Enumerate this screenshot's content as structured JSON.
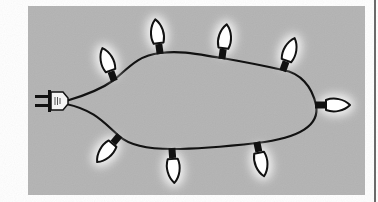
{
  "illustration": {
    "subject": "string of holiday lights with plug",
    "panel": {
      "x": 28,
      "y": 6,
      "width": 337,
      "height": 189,
      "fill": "#b3b3b3"
    },
    "colors": {
      "background": "#ffffff",
      "panel": "#b3b3b3",
      "wire": "#111111",
      "bulb_fill": "#ffffff",
      "bulb_outline": "#111111",
      "glow": "#ffffff",
      "edge_line": "#6a6a6a"
    },
    "plug": {
      "x": 35,
      "y": 92,
      "label": "plug-icon"
    },
    "bulbs": [
      {
        "id": "bulb-1",
        "base": [
          114,
          80
        ],
        "angle": -20
      },
      {
        "id": "bulb-2",
        "base": [
          160,
          53
        ],
        "angle": -8
      },
      {
        "id": "bulb-3",
        "base": [
          222,
          58
        ],
        "angle": 8
      },
      {
        "id": "bulb-4",
        "base": [
          283,
          70
        ],
        "angle": 20
      },
      {
        "id": "bulb-5",
        "base": [
          316,
          105
        ],
        "angle": 90
      },
      {
        "id": "bulb-6",
        "base": [
          257,
          143
        ],
        "angle": 168
      },
      {
        "id": "bulb-7",
        "base": [
          172,
          149
        ],
        "angle": 176
      },
      {
        "id": "bulb-8",
        "base": [
          119,
          136
        ],
        "angle": -140
      }
    ]
  }
}
